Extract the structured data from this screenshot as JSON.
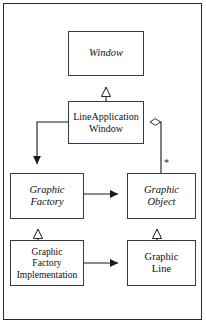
{
  "diagram": {
    "kind": "uml-class-diagram",
    "colors": {
      "frame_border": "#2b2b2b",
      "box_border": "#3a3a3a",
      "box_fill": "#ffffff",
      "line": "#1a1a1a",
      "text": "#101010",
      "page_background": "#ffffff"
    },
    "nodes": [
      {
        "id": "window",
        "label": "Window",
        "stereotype": "abstract"
      },
      {
        "id": "lineappwin",
        "label": "LineApplication\nWindow",
        "stereotype": "concrete"
      },
      {
        "id": "gfactory",
        "label": "Graphic\nFactory",
        "stereotype": "abstract"
      },
      {
        "id": "gobject",
        "label": "Graphic\nObject",
        "stereotype": "abstract"
      },
      {
        "id": "gfactoryimpl",
        "label": "Graphic\nFactory\nImplementation",
        "stereotype": "concrete"
      },
      {
        "id": "gline",
        "label": "Graphic\nLine",
        "stereotype": "concrete"
      }
    ],
    "edges": [
      {
        "id": "e1",
        "from": "lineappwin",
        "to": "window",
        "type": "inheritance",
        "marker": "hollow-triangle"
      },
      {
        "id": "e2",
        "from": "gfactoryimpl",
        "to": "gfactory",
        "type": "inheritance",
        "marker": "hollow-triangle"
      },
      {
        "id": "e3",
        "from": "gline",
        "to": "gobject",
        "type": "inheritance",
        "marker": "hollow-triangle"
      },
      {
        "id": "e4",
        "from": "lineappwin",
        "to": "gfactory",
        "type": "association",
        "marker": "solid-arrow"
      },
      {
        "id": "e5",
        "from": "gfactory",
        "to": "gobject",
        "type": "association",
        "marker": "solid-arrow"
      },
      {
        "id": "e6",
        "from": "gfactoryimpl",
        "to": "gline",
        "type": "association",
        "marker": "solid-arrow"
      },
      {
        "id": "e7",
        "from": "lineappwin",
        "to": "gobject",
        "type": "aggregation",
        "marker": "hollow-diamond",
        "multiplicity": "*"
      }
    ],
    "multiplicity_star": "*"
  }
}
